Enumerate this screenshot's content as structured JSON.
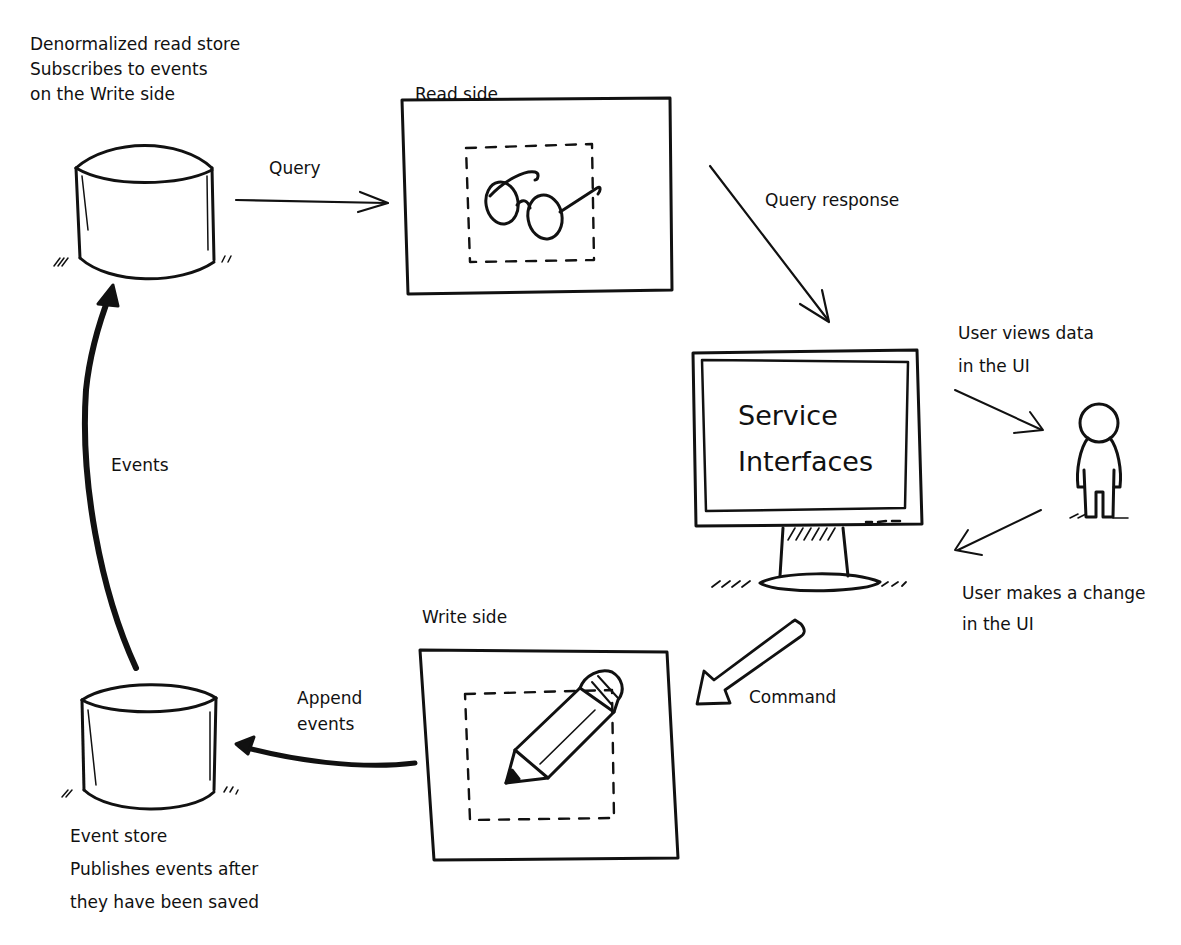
{
  "diagram": {
    "type": "CQRS / Event Sourcing flow",
    "stroke_color": "#111111",
    "background": "#ffffff"
  },
  "read_store": {
    "shape": "cylinder",
    "caption": [
      "Denormalized read store",
      "Subscribes to events",
      "on the Write side"
    ]
  },
  "read_side": {
    "title": "Read side",
    "icon": "glasses-icon"
  },
  "service_interfaces": {
    "shape": "monitor",
    "lines": [
      "Service",
      "Interfaces"
    ]
  },
  "user": {
    "shape": "person",
    "icon": "person-icon"
  },
  "write_side": {
    "title": "Write side",
    "icon": "pencil-icon"
  },
  "event_store": {
    "shape": "cylinder",
    "caption": [
      "Event store",
      "Publishes events after",
      "they have been saved"
    ]
  },
  "edges": {
    "query": "Query",
    "query_response": "Query response",
    "user_views": [
      "User views data",
      "in the UI"
    ],
    "user_changes": [
      "User makes a change",
      "in the UI"
    ],
    "command": "Command",
    "append_events": [
      "Append",
      "events"
    ],
    "events": "Events"
  }
}
